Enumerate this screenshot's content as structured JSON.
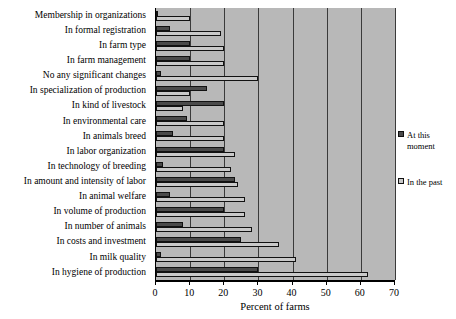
{
  "chart_data": {
    "type": "bar",
    "orientation": "horizontal",
    "title": "",
    "xlabel": "Percent of farms",
    "ylabel": "",
    "xlim": [
      0,
      70
    ],
    "xticks": [
      0,
      10,
      20,
      30,
      40,
      50,
      60,
      70
    ],
    "grid": true,
    "legend_position": "right",
    "categories": [
      "Membership in organizations",
      "In formal registration",
      "In farm type",
      "In farm management",
      "No any significant changes",
      "In specialization of production",
      "In kind of livestock",
      "In environmental care",
      "In animals breed",
      "In labor organization",
      "In technology of breeding",
      "In amount and intensity of labor",
      "In animal welfare",
      "In volume of production",
      "In number of animals",
      "In costs and investment",
      "In milk quality",
      "In hygiene of production"
    ],
    "series": [
      {
        "name": "At this moment",
        "color": "#4a4a4a",
        "values": [
          0.6,
          4,
          10,
          10,
          1.5,
          15,
          20,
          9,
          5,
          20,
          2,
          23,
          4,
          20,
          8,
          25,
          1.5,
          30
        ]
      },
      {
        "name": "In the past",
        "color": "#c9c9c9",
        "values": [
          10,
          19,
          20,
          20,
          30,
          10,
          8,
          20,
          20,
          23,
          22,
          24,
          26,
          26,
          28,
          36,
          41,
          62
        ]
      }
    ]
  },
  "legend": {
    "items": [
      {
        "label": "At this moment",
        "color": "#4a4a4a"
      },
      {
        "label": "In the past",
        "color": "#c9c9c9"
      }
    ]
  },
  "axis": {
    "x_title": "Percent of farms",
    "tick_labels": [
      "0",
      "10",
      "20",
      "30",
      "40",
      "50",
      "60",
      "70"
    ]
  }
}
